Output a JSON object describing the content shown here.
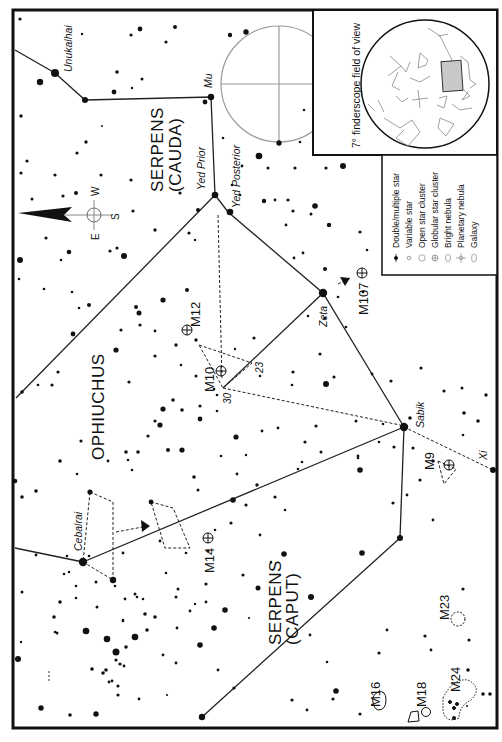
{
  "chart": {
    "orientation": "rotated 90 degrees clockwise",
    "constellations": [
      {
        "name": "SERPENS",
        "sub": "(CAUDA)"
      },
      {
        "name": "OPHIUCHUS"
      },
      {
        "name": "SERPENS",
        "sub": "(CAPUT)"
      }
    ],
    "star_names": {
      "unukalhai": "Unukalhai",
      "mu": "Mu",
      "yed_prior": "Yed Prior",
      "yed_posterior": "Yed Posterior",
      "zeta": "Zeta",
      "sabik": "Sabik",
      "xi": "Xi",
      "cebalrai": "Cebalrai"
    },
    "star_numbers": {
      "n23": "23",
      "n30": "30"
    },
    "deep_sky_objects": {
      "m12": "M12",
      "m10": "M10",
      "m107": "M107",
      "m9": "M9",
      "m14": "M14",
      "m23": "M23",
      "m16": "M16",
      "m18": "M18",
      "m24": "M24"
    },
    "compass": {
      "w": "W",
      "e": "E",
      "s": "S"
    },
    "finder_inset": {
      "caption": "7° finderscope field of view"
    },
    "legend": {
      "items": [
        {
          "symbol": "double-star",
          "label": "Double/multiple star"
        },
        {
          "symbol": "variable-star",
          "label": "Variable star"
        },
        {
          "symbol": "open-cluster",
          "label": "Open star cluster"
        },
        {
          "symbol": "globular-cluster",
          "label": "Globular star cluster"
        },
        {
          "symbol": "bright-nebula",
          "label": "Bright nebula"
        },
        {
          "symbol": "planetary-nebula",
          "label": "Planetary nebula"
        },
        {
          "symbol": "galaxy",
          "label": "Galaxy"
        }
      ]
    },
    "colors": {
      "ink": "#111111",
      "grid": "#9a9a9a",
      "highlight": "#c8c8c8",
      "paper": "#ffffff"
    }
  }
}
